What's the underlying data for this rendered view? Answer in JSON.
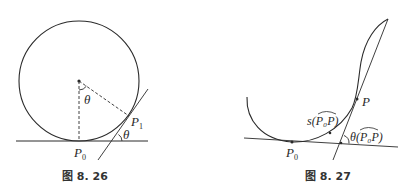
{
  "figures": [
    {
      "id": "fig-8-26",
      "caption": "图 8. 26",
      "labels": {
        "theta_center": "θ",
        "theta_tangent": "θ",
        "p1": "P",
        "p1_sub": "1",
        "p0": "P",
        "p0_sub": "0"
      },
      "description": "Circle rolling on a horizontal line; radius to P1 forms angle θ with vertical radius to P0; tangent at P1 forms angle θ with baseline"
    },
    {
      "id": "fig-8-27",
      "caption": "图 8. 27",
      "labels": {
        "p": "P",
        "p0": "P",
        "p0_sub": "0",
        "arc_length": "s(P₀P)",
        "arc_length_prefix": "s(",
        "arc_length_arc": "P₀P",
        "arc_length_suffix": ")",
        "angle": "θ(P₀P)",
        "angle_prefix": "θ(",
        "angle_arc": "P₀P",
        "angle_suffix": ")"
      },
      "description": "Plane curve with tangent at P0 and tangent at P; arc length s and tangent-angle θ of arc P0P"
    }
  ],
  "colors": {
    "stroke": "#2a2a2a",
    "background": "#ffffff"
  }
}
